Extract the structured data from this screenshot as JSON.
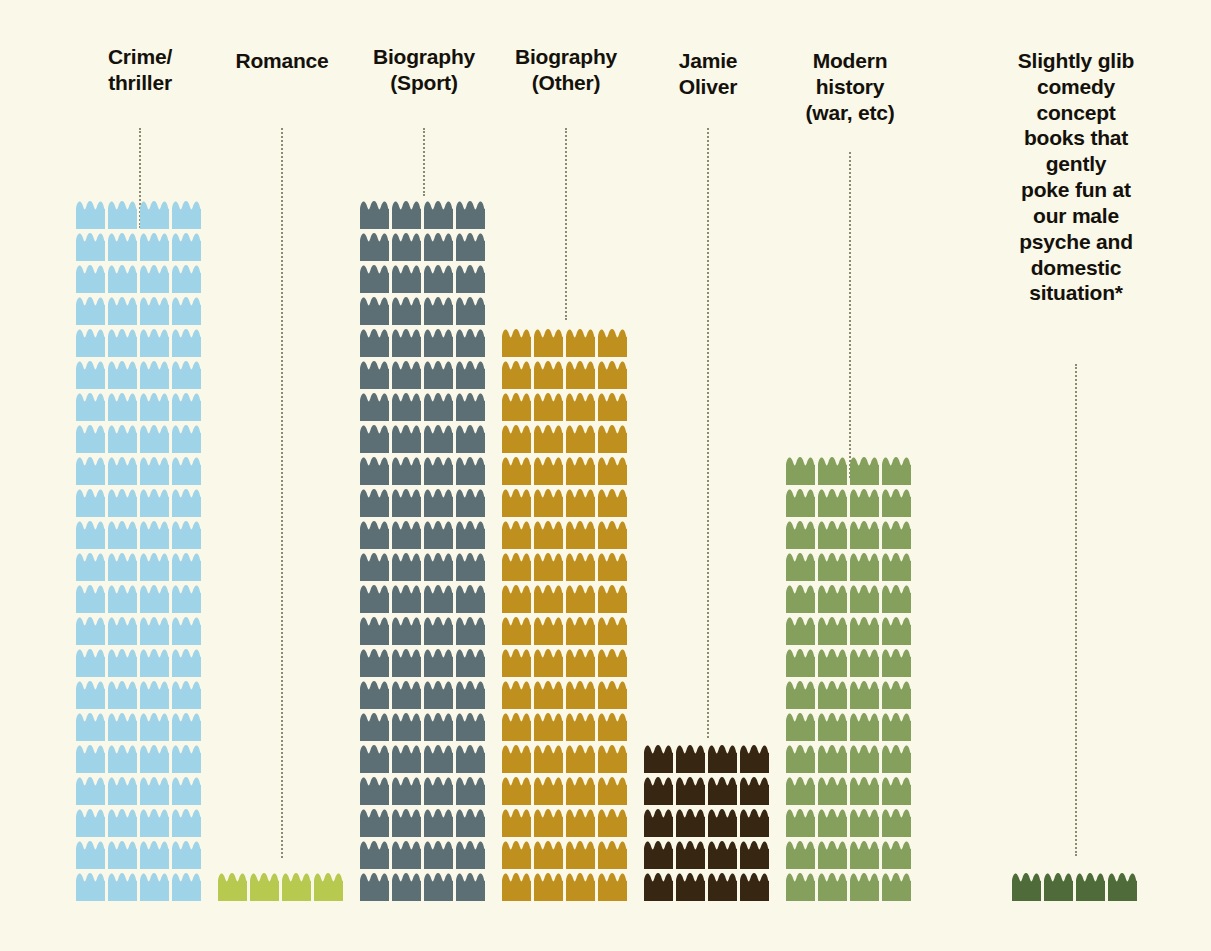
{
  "meta": {
    "background_color": "#FAF8E8",
    "label_color": "#14110C",
    "leader_line_color": "#8C8A72",
    "icon_name": "stack-of-books-icon"
  },
  "chart_data": {
    "type": "bar",
    "subtype": "pictogram-isotype",
    "title": "",
    "xlabel": "",
    "ylabel": "",
    "grid": false,
    "legend": false,
    "unit": "books per icon",
    "icons_per_row": 4,
    "categories": [
      "Crime/ thriller",
      "Romance",
      "Biography (Sport)",
      "Biography (Other)",
      "Jamie Oliver",
      "Modern history (war, etc)",
      "Slightly glib comedy concept books that gently poke fun at our male psyche and domestic situation*"
    ],
    "values": [
      88,
      4,
      88,
      72,
      20,
      56,
      4
    ],
    "rows": [
      22,
      1,
      22,
      18,
      5,
      14,
      1
    ],
    "colors": [
      "#9FD3E8",
      "#B7C94F",
      "#5C6F74",
      "#C0901E",
      "#362612",
      "#84A05C",
      "#4F6B3A"
    ]
  },
  "series": [
    {
      "key": "crime-thriller",
      "label_lines": [
        "Crime/",
        "thriller"
      ],
      "rows": 22,
      "columns": 4,
      "total_icons": 88,
      "color": "#9FD3E8",
      "left": 76,
      "label_top": 44,
      "leader_top": 128,
      "leader_height": 100
    },
    {
      "key": "romance",
      "label_lines": [
        "Romance"
      ],
      "rows": 1,
      "columns": 4,
      "total_icons": 4,
      "color": "#B7C94F",
      "left": 218,
      "label_top": 48,
      "leader_top": 128,
      "leader_height": 730
    },
    {
      "key": "biography-sport",
      "label_lines": [
        "Biography",
        "(Sport)"
      ],
      "rows": 22,
      "columns": 4,
      "total_icons": 88,
      "color": "#5C6F74",
      "left": 360,
      "label_top": 44,
      "leader_top": 128,
      "leader_height": 68
    },
    {
      "key": "biography-other",
      "label_lines": [
        "Biography",
        "(Other)"
      ],
      "rows": 18,
      "columns": 4,
      "total_icons": 72,
      "color": "#C0901E",
      "left": 502,
      "label_top": 44,
      "leader_top": 128,
      "leader_height": 192
    },
    {
      "key": "jamie-oliver",
      "label_lines": [
        "Jamie",
        "Oliver"
      ],
      "rows": 5,
      "columns": 4,
      "total_icons": 20,
      "color": "#362612",
      "left": 644,
      "label_top": 48,
      "leader_top": 128,
      "leader_height": 610
    },
    {
      "key": "modern-history",
      "label_lines": [
        "Modern",
        "history",
        "(war, etc)"
      ],
      "rows": 14,
      "columns": 4,
      "total_icons": 56,
      "color": "#84A05C",
      "left": 786,
      "label_top": 48,
      "leader_top": 152,
      "leader_height": 326
    },
    {
      "key": "glib-comedy",
      "label_lines": [
        "Slightly glib",
        "comedy",
        "concept",
        "books that",
        "gently",
        "poke fun at",
        "our male",
        "psyche and",
        "domestic",
        "situation*"
      ],
      "rows": 1,
      "columns": 4,
      "total_icons": 4,
      "color": "#4F6B3A",
      "left": 1012,
      "label_top": 48,
      "leader_top": 364,
      "leader_height": 492
    }
  ]
}
